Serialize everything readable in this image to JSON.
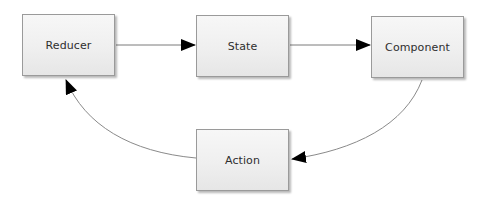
{
  "diagram": {
    "title": "",
    "nodes": [
      {
        "id": "reducer",
        "label": "Reducer"
      },
      {
        "id": "state",
        "label": "State"
      },
      {
        "id": "component",
        "label": "Component"
      },
      {
        "id": "action",
        "label": "Action"
      }
    ],
    "edges": [
      {
        "from": "reducer",
        "to": "state",
        "style": "straight"
      },
      {
        "from": "state",
        "to": "component",
        "style": "straight"
      },
      {
        "from": "component",
        "to": "action",
        "style": "curved"
      },
      {
        "from": "action",
        "to": "reducer",
        "style": "curved"
      }
    ],
    "colors": {
      "node_border": "#9a9a9a",
      "node_fill": "#efefef",
      "edge": "#808080",
      "arrowhead": "#000000",
      "text": "#2e2e2e"
    }
  }
}
